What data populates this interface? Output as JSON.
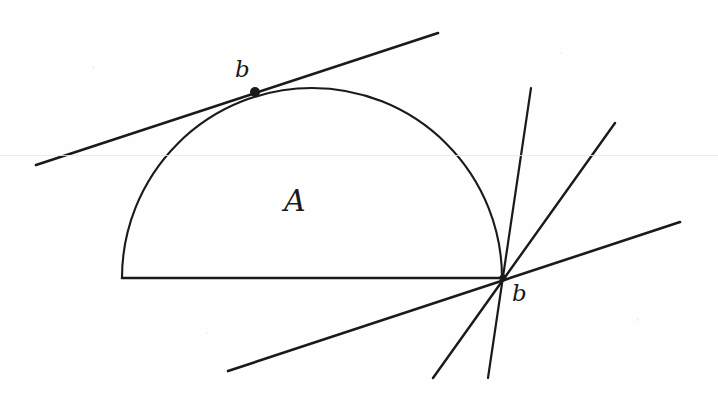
{
  "figure": {
    "background_color": "#fefefe",
    "ink_color": "#1a1a1a",
    "artifact_color": "#e9e9ec",
    "labels": {
      "region": "A",
      "boundary_point_top": "b",
      "boundary_point_vertex": "b"
    },
    "geometry": {
      "region_shape": "half-disk",
      "arc": {
        "center_x": 312,
        "center_y": 278,
        "radius": 190,
        "start_angle_deg": 180,
        "end_angle_deg": 0,
        "apex_x": 312,
        "apex_y": 88
      },
      "chord": {
        "x1": 122,
        "y1": 278,
        "x2": 503,
        "y2": 278
      },
      "tangent_point_top": {
        "x": 255,
        "y": 92,
        "dot_radius": 5
      },
      "vertex_point": {
        "x": 503,
        "y": 278
      },
      "lines": [
        {
          "name": "tangent-line-top",
          "x1": 36,
          "y1": 165,
          "x2": 438,
          "y2": 33
        },
        {
          "name": "supporting-line-near-vertical",
          "x1": 531,
          "y1": 88,
          "x2": 488,
          "y2": 378
        },
        {
          "name": "supporting-line-steep",
          "x1": 615,
          "y1": 123,
          "x2": 433,
          "y2": 378
        },
        {
          "name": "supporting-line-shallow",
          "x1": 228,
          "y1": 371,
          "x2": 680,
          "y2": 222
        }
      ],
      "scan_artifact_y": 155
    },
    "stroke_widths": {
      "arc": 2.0,
      "chord": 2.4,
      "line": 2.4
    }
  }
}
